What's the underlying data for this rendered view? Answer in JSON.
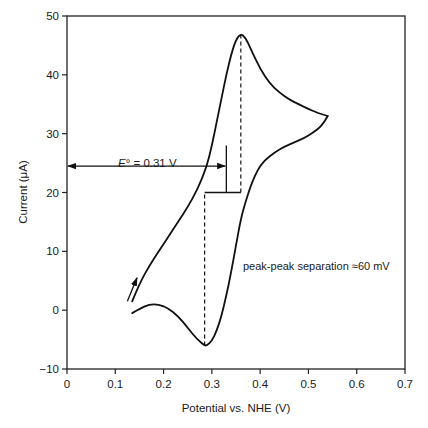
{
  "chart_data": {
    "type": "line",
    "title": "",
    "xlabel": "Potential vs. NHE (V)",
    "ylabel": "Current (μA)",
    "xlim": [
      0,
      0.7
    ],
    "ylim": [
      -10,
      50
    ],
    "xticks": [
      0,
      0.1,
      0.2,
      0.3,
      0.4,
      0.5,
      0.6,
      0.7
    ],
    "xtick_labels": [
      "0",
      "0.1",
      "0.2",
      "0.3",
      "0.4",
      "0.5",
      "0.6",
      "0.7"
    ],
    "yticks": [
      -10,
      0,
      10,
      20,
      30,
      40,
      50
    ],
    "ytick_labels": [
      "−10",
      "0",
      "10",
      "20",
      "30",
      "40",
      "50"
    ],
    "grid": false,
    "legend": null,
    "series": [
      {
        "name": "Forward (anodic) sweep",
        "x": [
          0.135,
          0.15,
          0.17,
          0.19,
          0.21,
          0.23,
          0.25,
          0.27,
          0.29,
          0.3,
          0.31,
          0.32,
          0.33,
          0.34,
          0.35,
          0.36,
          0.37,
          0.38,
          0.4,
          0.42,
          0.44,
          0.46,
          0.48,
          0.5,
          0.52,
          0.54
        ],
        "y": [
          1.5,
          4.5,
          7.5,
          10,
          12.5,
          15,
          17.5,
          20.5,
          24.5,
          28,
          32,
          36,
          40,
          43.5,
          46,
          47,
          46.3,
          44.5,
          41,
          38.5,
          37,
          35.8,
          35,
          34.2,
          33.5,
          33
        ]
      },
      {
        "name": "Reverse (cathodic) sweep",
        "x": [
          0.54,
          0.53,
          0.51,
          0.49,
          0.47,
          0.45,
          0.43,
          0.41,
          0.4,
          0.39,
          0.38,
          0.37,
          0.36,
          0.35,
          0.34,
          0.33,
          0.32,
          0.31,
          0.3,
          0.29,
          0.285,
          0.27,
          0.25,
          0.23,
          0.21,
          0.19,
          0.17,
          0.15,
          0.135
        ],
        "y": [
          33,
          31.5,
          30.2,
          29.2,
          28.5,
          27.8,
          26.8,
          25.5,
          24.5,
          23,
          21,
          18.5,
          15.5,
          11,
          6.5,
          2.5,
          -1,
          -3.5,
          -5.2,
          -6,
          -6,
          -5,
          -3,
          -1,
          0.3,
          1,
          1,
          0.2,
          -0.5
        ]
      }
    ],
    "annotations": [
      {
        "type": "text",
        "text_prefix": "E",
        "text_suffix": "° = 0.31 V",
        "x": 0.035,
        "y": 26.5
      },
      {
        "type": "double-arrow",
        "from": [
          0,
          24.5
        ],
        "to": [
          0.33,
          24.5
        ]
      },
      {
        "type": "vline",
        "x": 0.33,
        "y_range": [
          20,
          28
        ]
      },
      {
        "type": "hbar",
        "y": 20,
        "x_range": [
          0.285,
          0.36
        ]
      },
      {
        "type": "dashed-vline",
        "x": 0.285,
        "y_range": [
          -6,
          20
        ],
        "label": "cathodic peak potential"
      },
      {
        "type": "dashed-vline",
        "x": 0.36,
        "y_range": [
          20,
          47
        ],
        "label": "anodic peak potential"
      },
      {
        "type": "text",
        "text": "peak-peak separation ≈60 mV",
        "x": 0.385,
        "y": 3
      },
      {
        "type": "arrow",
        "from": [
          0.125,
          1.5
        ],
        "to": [
          0.145,
          5.5
        ],
        "label": "sweep direction"
      }
    ],
    "peaks": {
      "anodic": {
        "E_V": 0.36,
        "I_uA": 47
      },
      "cathodic": {
        "E_V": 0.285,
        "I_uA": -6
      },
      "E0_V": 0.31,
      "separation_mV": 60
    }
  },
  "labels": {
    "xlabel": "Potential vs. NHE (V)",
    "ylabel": "Current (μA)",
    "e0_italic": "E",
    "e0_rest": "° = 0.31 V",
    "separation": "peak-peak separation ≈60 mV"
  },
  "colors": {
    "line": "#111111",
    "axis": "#222222",
    "background": "#ffffff"
  }
}
